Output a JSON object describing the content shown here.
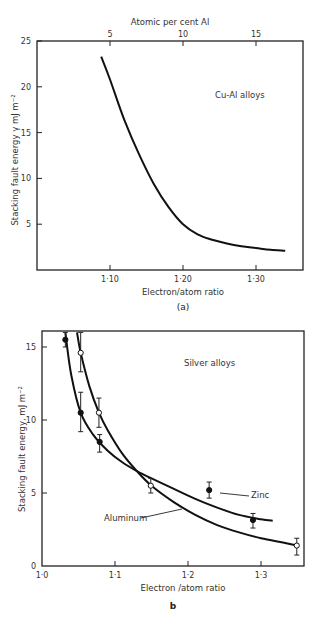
{
  "chart_data": [
    {
      "id": "a",
      "type": "line",
      "caption": "(a)",
      "annotation": "Cu-Al alloys",
      "xlabel": "Electron/atom ratio",
      "ylabel": "Stacking fault energy γ mJ m⁻²",
      "top_xlabel": "Atomic per cent Al",
      "xlim": [
        1.063,
        1.38
      ],
      "ylim": [
        0,
        25
      ],
      "x_ticks": [
        1.1,
        1.2,
        1.3
      ],
      "x_tick_labels": [
        "1·10",
        "1·20",
        "1·30"
      ],
      "top_x_ticks": [
        1.1,
        1.2,
        1.3
      ],
      "top_x_tick_labels": [
        "5",
        "10",
        "15"
      ],
      "y_ticks": [
        5,
        10,
        15,
        20,
        25
      ],
      "y_tick_labels": [
        "5",
        "10",
        "15",
        "20",
        "25"
      ],
      "grid": false,
      "series": [
        {
          "name": "Cu-Al",
          "x": [
            1.088,
            1.1,
            1.12,
            1.14,
            1.16,
            1.18,
            1.2,
            1.22,
            1.24,
            1.26,
            1.28,
            1.3,
            1.32,
            1.34
          ],
          "y": [
            23.3,
            20.8,
            16.3,
            12.6,
            9.4,
            6.9,
            5.0,
            3.9,
            3.3,
            2.9,
            2.6,
            2.4,
            2.2,
            2.1
          ]
        }
      ]
    },
    {
      "id": "b",
      "type": "line",
      "caption": "b",
      "annotation": "Silver alloys",
      "xlabel": "Electron /atom ratio",
      "ylabel": "Stacking fault energy, mJ m⁻²",
      "xlim": [
        1.0,
        1.358
      ],
      "ylim": [
        0,
        16
      ],
      "x_ticks": [
        1.0,
        1.1,
        1.2,
        1.3
      ],
      "x_tick_labels": [
        "1·0",
        "1·1",
        "1·2",
        "1·3"
      ],
      "y_ticks": [
        0,
        5,
        10,
        15
      ],
      "y_tick_labels": [
        "0",
        "5",
        "10",
        "15"
      ],
      "grid": false,
      "series": [
        {
          "name": "Zinc",
          "marker": "filled-circle",
          "points": [
            {
              "x": 1.032,
              "y": 15.5,
              "err_low": 15.0,
              "err_high": 16.0
            },
            {
              "x": 1.053,
              "y": 10.5,
              "err_low": 9.2,
              "err_high": 11.9
            },
            {
              "x": 1.079,
              "y": 8.5,
              "err_low": 7.8,
              "err_high": 9.0
            },
            {
              "x": 1.229,
              "y": 5.2,
              "err_low": 4.65,
              "err_high": 5.75
            },
            {
              "x": 1.289,
              "y": 3.15,
              "err_low": 2.6,
              "err_high": 3.6
            }
          ],
          "curve_x": [
            1.032,
            1.04,
            1.053,
            1.07,
            1.09,
            1.11,
            1.13,
            1.15,
            1.18,
            1.21,
            1.24,
            1.27,
            1.3,
            1.316
          ],
          "curve_y": [
            16.0,
            13.1,
            10.5,
            9.0,
            7.9,
            7.1,
            6.5,
            6.0,
            5.3,
            4.6,
            4.0,
            3.5,
            3.2,
            3.1
          ]
        },
        {
          "name": "Aluminum",
          "marker": "open-circle",
          "points": [
            {
              "x": 1.053,
              "y": 14.6,
              "err_low": 13.3,
              "err_high": 16.0
            },
            {
              "x": 1.078,
              "y": 10.5,
              "err_low": 9.5,
              "err_high": 11.5
            },
            {
              "x": 1.149,
              "y": 5.5,
              "err_low": 5.0,
              "err_high": 6.0
            },
            {
              "x": 1.349,
              "y": 1.4,
              "err_low": 0.75,
              "err_high": 1.9
            }
          ],
          "curve_x": [
            1.048,
            1.053,
            1.065,
            1.078,
            1.09,
            1.11,
            1.13,
            1.15,
            1.18,
            1.21,
            1.24,
            1.27,
            1.3,
            1.33,
            1.349
          ],
          "curve_y": [
            16.0,
            14.6,
            12.3,
            10.5,
            9.3,
            7.7,
            6.5,
            5.5,
            4.4,
            3.5,
            2.8,
            2.3,
            1.9,
            1.6,
            1.4
          ]
        }
      ],
      "legend_labels": {
        "zinc": "Zinc",
        "aluminum": "Aluminum"
      }
    }
  ]
}
